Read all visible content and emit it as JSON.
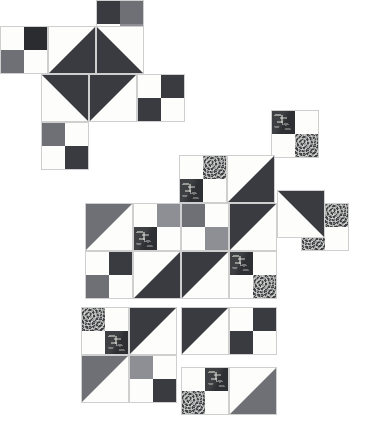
{
  "artwork": {
    "title": "Scrappy Quilt Block Layout",
    "canvas": {
      "width": 392,
      "height": 432
    },
    "background_color": "#ffffff",
    "unit_size": 48,
    "cell_size": 24,
    "seam_color": "#cfcfcf"
  },
  "palette": {
    "charcoal": "#3a3b40",
    "dark_charcoal": "#2b2c30",
    "mid_gray": "#6f7075",
    "light_gray": "#8e8f94",
    "white": "#fdfdfb",
    "cream": "#f7f6f1",
    "leaf_print": "#333438",
    "spiral_print": "#4a4b50"
  },
  "legend": {
    "unit_types": [
      {
        "code": "hst",
        "label": "Half-Square Triangle"
      },
      {
        "code": "fourpatch",
        "label": "Four Patch"
      }
    ],
    "fabrics": [
      {
        "code": "charcoal",
        "label": "Charcoal Solid"
      },
      {
        "code": "mid_gray",
        "label": "Medium Gray Solid"
      },
      {
        "code": "white",
        "label": "White Solid"
      },
      {
        "code": "leaf_print",
        "label": "Dark Leaf Print"
      },
      {
        "code": "spiral_print",
        "label": "Gray Spiral Print"
      }
    ]
  },
  "units": [
    {
      "name": "unit-r0-c4-fourpatch",
      "x": 96,
      "y": 0,
      "type": "fourpatch",
      "cells": [
        "charcoal",
        "mid_gray",
        "white",
        "light_gray"
      ]
    },
    {
      "name": "unit-r1-c0-fourpatch",
      "x": 0,
      "y": 26,
      "type": "fourpatch",
      "cells": [
        "white",
        "dark_charcoal",
        "mid_gray",
        "white"
      ]
    },
    {
      "name": "unit-r1-c2-hst",
      "x": 48,
      "y": 26,
      "type": "hst",
      "orient": "br",
      "fg": "charcoal",
      "bg": "white"
    },
    {
      "name": "unit-r1-c4-hst",
      "x": 96,
      "y": 26,
      "type": "hst",
      "orient": "bl",
      "fg": "charcoal",
      "bg": "white"
    },
    {
      "name": "unit-r2-c2-hst",
      "x": 41,
      "y": 74,
      "type": "hst",
      "orient": "tr",
      "fg": "charcoal",
      "bg": "white"
    },
    {
      "name": "unit-r2-c4-hst",
      "x": 89,
      "y": 74,
      "type": "hst",
      "orient": "tl",
      "fg": "charcoal",
      "bg": "white"
    },
    {
      "name": "unit-r2-c6-fourpatch",
      "x": 137,
      "y": 74,
      "type": "fourpatch",
      "cells": [
        "white",
        "charcoal",
        "charcoal",
        "white"
      ]
    },
    {
      "name": "unit-r3-c2-fourpatch",
      "x": 41,
      "y": 122,
      "type": "fourpatch",
      "cells": [
        "mid_gray",
        "white",
        "white",
        "charcoal"
      ]
    },
    {
      "name": "unit-r3-c11-fourpatch",
      "x": 271,
      "y": 110,
      "type": "fourpatch",
      "cells": [
        "leaf_print",
        "white",
        "white",
        "spiral_print"
      ]
    },
    {
      "name": "unit-r4-c7-fourpatch",
      "x": 179,
      "y": 155,
      "type": "fourpatch",
      "cells": [
        "white",
        "spiral_print",
        "leaf_print",
        "white"
      ]
    },
    {
      "name": "unit-r4-c9-hst",
      "x": 227,
      "y": 155,
      "type": "hst",
      "orient": "br",
      "fg": "charcoal",
      "bg": "white"
    },
    {
      "name": "unit-r5-c3-hst",
      "x": 85,
      "y": 203,
      "type": "hst",
      "orient": "tl",
      "fg": "mid_gray",
      "bg": "white"
    },
    {
      "name": "unit-r5-c5-fourpatch",
      "x": 133,
      "y": 203,
      "type": "fourpatch",
      "cells": [
        "white",
        "light_gray",
        "leaf_print",
        "white"
      ]
    },
    {
      "name": "unit-r5-c7-fourpatch",
      "x": 181,
      "y": 203,
      "type": "fourpatch",
      "cells": [
        "mid_gray",
        "white",
        "white",
        "light_gray"
      ]
    },
    {
      "name": "unit-r5-c9-hst",
      "x": 229,
      "y": 203,
      "type": "hst",
      "orient": "tl",
      "fg": "charcoal",
      "bg": "white"
    },
    {
      "name": "unit-r5-c11-fourpatch",
      "x": 301,
      "y": 203,
      "type": "fourpatch",
      "cells": [
        "white",
        "spiral_print",
        "spiral_print",
        "white"
      ]
    },
    {
      "name": "unit-r5-c13-hst",
      "x": 277,
      "y": 190,
      "type": "hst",
      "orient": "tr",
      "fg": "charcoal",
      "bg": "white"
    },
    {
      "name": "unit-r6-c3-fourpatch",
      "x": 85,
      "y": 251,
      "type": "fourpatch",
      "cells": [
        "white",
        "charcoal",
        "mid_gray",
        "white"
      ]
    },
    {
      "name": "unit-r6-c5-hst",
      "x": 133,
      "y": 251,
      "type": "hst",
      "orient": "br",
      "fg": "charcoal",
      "bg": "white"
    },
    {
      "name": "unit-r6-c7-hst",
      "x": 181,
      "y": 251,
      "type": "hst",
      "orient": "tl",
      "fg": "charcoal",
      "bg": "white"
    },
    {
      "name": "unit-r6-c9-fourpatch",
      "x": 229,
      "y": 251,
      "type": "fourpatch",
      "cells": [
        "leaf_print",
        "white",
        "white",
        "spiral_print"
      ]
    },
    {
      "name": "unit-r7-c3-fourpatch",
      "x": 81,
      "y": 307,
      "type": "fourpatch",
      "cells": [
        "spiral_print",
        "white",
        "white",
        "leaf_print"
      ]
    },
    {
      "name": "unit-r7-c5-hst",
      "x": 129,
      "y": 307,
      "type": "hst",
      "orient": "tl",
      "fg": "charcoal",
      "bg": "white"
    },
    {
      "name": "unit-r7-c8-hst",
      "x": 181,
      "y": 307,
      "type": "hst",
      "orient": "tl",
      "fg": "charcoal",
      "bg": "white"
    },
    {
      "name": "unit-r7-c10-fourpatch",
      "x": 229,
      "y": 307,
      "type": "fourpatch",
      "cells": [
        "white",
        "charcoal",
        "charcoal",
        "white"
      ]
    },
    {
      "name": "unit-r8-c3-hst",
      "x": 81,
      "y": 355,
      "type": "hst",
      "orient": "tl",
      "fg": "mid_gray",
      "bg": "white"
    },
    {
      "name": "unit-r8-c5-fourpatch",
      "x": 129,
      "y": 355,
      "type": "fourpatch",
      "cells": [
        "light_gray",
        "white",
        "white",
        "charcoal"
      ]
    },
    {
      "name": "unit-r8-c8-fourpatch",
      "x": 181,
      "y": 367,
      "type": "fourpatch",
      "cells": [
        "white",
        "leaf_print",
        "spiral_print",
        "white"
      ]
    },
    {
      "name": "unit-r8-c10-hst",
      "x": 229,
      "y": 367,
      "type": "hst",
      "orient": "br",
      "fg": "mid_gray",
      "bg": "white"
    }
  ]
}
